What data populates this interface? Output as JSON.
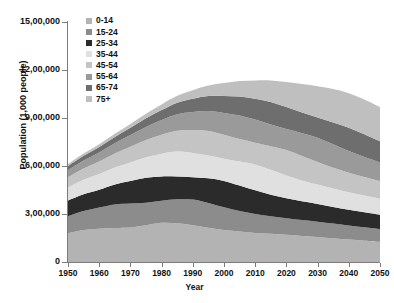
{
  "chart_data": {
    "type": "area",
    "stacked": true,
    "title": "",
    "xlabel": "Year",
    "ylabel": "Population (1,000 people)",
    "x": [
      1950,
      1955,
      1960,
      1965,
      1970,
      1975,
      1980,
      1985,
      1990,
      1995,
      2000,
      2005,
      2010,
      2015,
      2020,
      2025,
      2030,
      2035,
      2040,
      2045,
      2050
    ],
    "xlim": [
      1950,
      2050
    ],
    "ylim": [
      0,
      1500000
    ],
    "xticks": [
      "1950",
      "1960",
      "1970",
      "1980",
      "1990",
      "2000",
      "2010",
      "2020",
      "2030",
      "2040",
      "2050"
    ],
    "yticks": [
      "0",
      "3,00,000",
      "6,00,000",
      "9,00,000",
      "12,00,000",
      "15,00,000"
    ],
    "ytick_values": [
      0,
      300000,
      600000,
      900000,
      1200000,
      1500000
    ],
    "grid": false,
    "legend_position": "top-left",
    "number_format": "indian",
    "peak_year": 2022,
    "peak_total": 1452000,
    "series": [
      {
        "name": "0-14",
        "color": "#b3b3b3",
        "values": [
          180000,
          200000,
          208000,
          212000,
          215000,
          230000,
          245000,
          242000,
          230000,
          214000,
          200000,
          190000,
          182000,
          176000,
          170000,
          163000,
          156000,
          148000,
          140000,
          133000,
          126000
        ]
      },
      {
        "name": "15-24",
        "color": "#8c8c8c",
        "values": [
          105000,
          118000,
          132000,
          148000,
          150000,
          140000,
          138000,
          150000,
          160000,
          155000,
          142000,
          128000,
          118000,
          110000,
          104000,
          100000,
          96000,
          92000,
          88000,
          84000,
          80000
        ]
      },
      {
        "name": "25-34",
        "color": "#2b2b2b",
        "values": [
          100000,
          106000,
          112000,
          125000,
          142000,
          156000,
          152000,
          142000,
          140000,
          154000,
          165000,
          160000,
          148000,
          134000,
          124000,
          116000,
          110000,
          104000,
          99000,
          94000,
          90000
        ]
      },
      {
        "name": "35-44",
        "color": "#e0e0e0",
        "values": [
          82000,
          90000,
          98000,
          105000,
          115000,
          128000,
          142000,
          156000,
          152000,
          142000,
          138000,
          150000,
          162000,
          156000,
          143000,
          131000,
          122000,
          115000,
          109000,
          104000,
          99000
        ]
      },
      {
        "name": "45-54",
        "color": "#c4c4c4",
        "values": [
          62000,
          70000,
          78000,
          88000,
          98000,
          108000,
          118000,
          130000,
          142000,
          154000,
          150000,
          140000,
          136000,
          148000,
          159000,
          153000,
          141000,
          130000,
          122000,
          116000,
          110000
        ]
      },
      {
        "name": "55-64",
        "color": "#9a9a9a",
        "values": [
          45000,
          50000,
          57000,
          64000,
          73000,
          82000,
          93000,
          104000,
          114000,
          125000,
          137000,
          148000,
          144000,
          135000,
          131000,
          142000,
          152000,
          147000,
          136000,
          126000,
          118000
        ]
      },
      {
        "name": "65-74",
        "color": "#6e6e6e",
        "values": [
          26000,
          30000,
          34000,
          39000,
          46000,
          54000,
          62000,
          72000,
          83000,
          94000,
          106000,
          118000,
          130000,
          141000,
          137000,
          129000,
          126000,
          136000,
          145000,
          141000,
          131000
        ]
      },
      {
        "name": "75+",
        "color": "#bfbfbf",
        "values": [
          12000,
          14000,
          17000,
          20000,
          24000,
          29000,
          35000,
          43000,
          53000,
          65000,
          80000,
          97000,
          115000,
          135000,
          157000,
          178000,
          196000,
          209000,
          216000,
          218000,
          215000
        ]
      }
    ]
  },
  "legend": {
    "items": [
      {
        "label": "0-14",
        "color": "#b3b3b3"
      },
      {
        "label": "15-24",
        "color": "#8c8c8c"
      },
      {
        "label": "25-34",
        "color": "#2b2b2b"
      },
      {
        "label": "35-44",
        "color": "#e0e0e0"
      },
      {
        "label": "45-54",
        "color": "#c4c4c4"
      },
      {
        "label": "55-64",
        "color": "#9a9a9a"
      },
      {
        "label": "65-74",
        "color": "#6e6e6e"
      },
      {
        "label": "75+",
        "color": "#bfbfbf"
      }
    ]
  },
  "axes": {
    "y_title": "Population (1,000 people)",
    "x_title": "Year",
    "y_ticks": [
      "15,00,000",
      "12,00,000",
      "9,00,000",
      "6,00,000",
      "3,00,000",
      "0"
    ],
    "x_ticks": [
      "1950",
      "1960",
      "1970",
      "1980",
      "1990",
      "2000",
      "2010",
      "2020",
      "2030",
      "2040",
      "2050"
    ]
  }
}
